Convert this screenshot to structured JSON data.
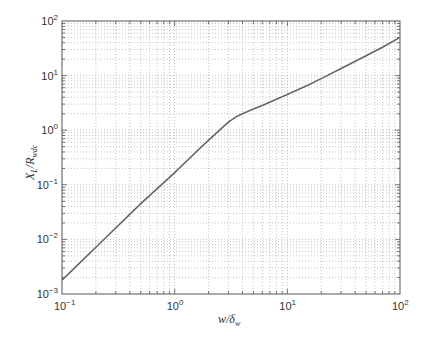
{
  "chart_data": {
    "type": "line",
    "title": "",
    "xlabel": "w/δ_w",
    "ylabel": "X_L/R_wdc",
    "xscale": "log",
    "yscale": "log",
    "xlim": [
      0.1,
      100
    ],
    "ylim": [
      0.001,
      100
    ],
    "grid": true,
    "legend": null,
    "x_ticks": [
      {
        "base": "10",
        "exp": "−1",
        "value": 0.1
      },
      {
        "base": "10",
        "exp": "0",
        "value": 1
      },
      {
        "base": "10",
        "exp": "1",
        "value": 10
      },
      {
        "base": "10",
        "exp": "2",
        "value": 100
      }
    ],
    "y_ticks": [
      {
        "base": "10",
        "exp": "−3",
        "value": 0.001
      },
      {
        "base": "10",
        "exp": "−2",
        "value": 0.01
      },
      {
        "base": "10",
        "exp": "−1",
        "value": 0.1
      },
      {
        "base": "10",
        "exp": "0",
        "value": 1
      },
      {
        "base": "10",
        "exp": "1",
        "value": 10
      },
      {
        "base": "10",
        "exp": "2",
        "value": 100
      }
    ],
    "series": [
      {
        "name": "X_L/R_wdc",
        "color": "#666666",
        "x": [
          0.1,
          0.2,
          0.5,
          1,
          1.5,
          2,
          2.5,
          3,
          3.5,
          4,
          5,
          6,
          8,
          10,
          15,
          20,
          30,
          50,
          70,
          100
        ],
        "y": [
          0.0018,
          0.0072,
          0.045,
          0.167,
          0.375,
          0.66,
          1.0,
          1.4,
          1.75,
          2.0,
          2.45,
          2.85,
          3.7,
          4.5,
          6.6,
          8.8,
          13.5,
          23,
          33,
          50
        ]
      }
    ]
  },
  "labels": {
    "xlabel_main": "w/",
    "xlabel_greek": "δ",
    "xlabel_sub": "w",
    "ylabel_main": "X",
    "ylabel_sub1": "L",
    "ylabel_sep": "/R",
    "ylabel_sub2": "wdc"
  },
  "colors": {
    "curve": "#666666",
    "grid": "#9a9a9a",
    "frame": "#555555",
    "background": "#ffffff"
  }
}
